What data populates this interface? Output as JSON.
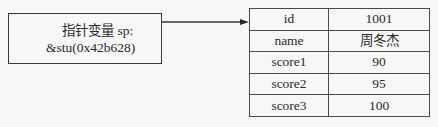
{
  "pointer": {
    "label_line1": "指针变量 sp:",
    "label_line2": "&stu(0x42b628)"
  },
  "struct": {
    "rows": [
      {
        "field": "id",
        "value": "1001"
      },
      {
        "field": "name",
        "value": "周冬杰"
      },
      {
        "field": "score1",
        "value": "90"
      },
      {
        "field": "score2",
        "value": "95"
      },
      {
        "field": "score3",
        "value": "100"
      }
    ]
  },
  "colors": {
    "line": "#3a3a3a",
    "background": "#f7f7f5",
    "text": "#2a2a2a"
  }
}
